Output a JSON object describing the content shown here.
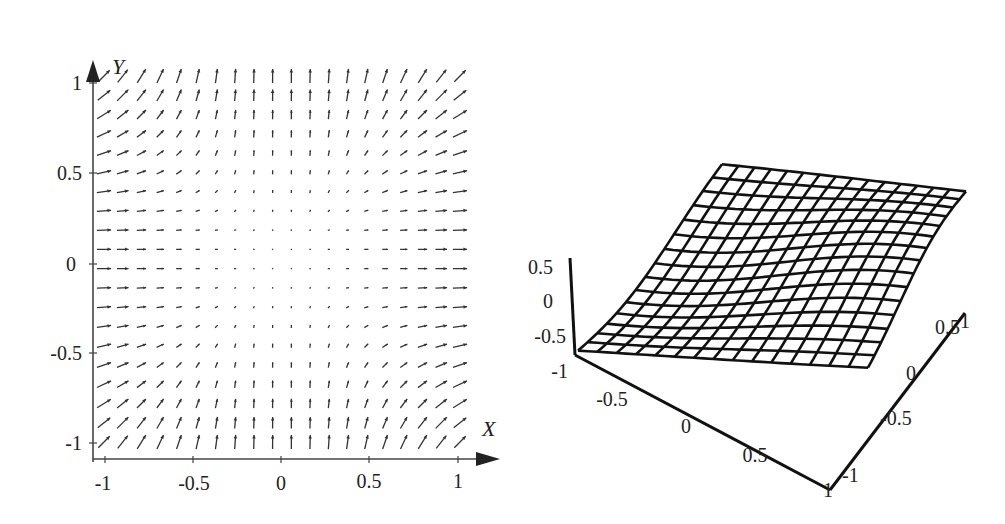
{
  "chart_data": [
    {
      "type": "quiver",
      "title": "",
      "xlabel": "X",
      "ylabel": "Y",
      "xlim": [
        -1,
        1
      ],
      "ylim": [
        -1,
        1
      ],
      "xticks": [
        "-1",
        "-0.5",
        "0",
        "0.5",
        "1"
      ],
      "yticks": [
        "1",
        "0.5",
        "0",
        "-0.5",
        "-1"
      ],
      "grid": false,
      "grid_points": 20,
      "field_description": "Vector field with arrows approximately proportional to (x^2, y^2): near-zero at origin, pointing right on left/right edges, pointing up on top/bottom edges, diagonal up-right at corners",
      "arrow_color": "#333333"
    },
    {
      "type": "surface",
      "title": "",
      "x_ticks": [
        "-1",
        "-0.5",
        "0",
        "0.5",
        "1"
      ],
      "y_ticks": [
        "-1",
        "-0.5",
        "0",
        "0.5",
        "1"
      ],
      "z_ticks": [
        "0.5",
        "0",
        "-0.5",
        "-1"
      ],
      "xlim": [
        -1,
        1
      ],
      "ylim": [
        -1,
        1
      ],
      "zlim": [
        -1,
        0.5
      ],
      "mesh_size": [
        15,
        15
      ],
      "surface_description": "Wireframe mesh of a gently wavy surface, low at front corner, rising toward back with slight undulation",
      "line_color": "#111111"
    }
  ],
  "left_plot": {
    "x_axis_label": "X",
    "y_axis_label": "Y",
    "x_tick_labels": [
      "-1",
      "-0.5",
      "0",
      "0.5",
      "1"
    ],
    "y_tick_labels": [
      "1",
      "0.5",
      "0",
      "-0.5",
      "-1"
    ]
  },
  "right_plot": {
    "z_tick_labels": [
      "0.5",
      "0",
      "-0.5",
      "-1"
    ],
    "front_axis_labels": [
      "-0.5",
      "0",
      "0.5",
      "1"
    ],
    "right_axis_labels": [
      "1",
      "0.5",
      "0",
      "-0.5",
      "-1"
    ]
  }
}
